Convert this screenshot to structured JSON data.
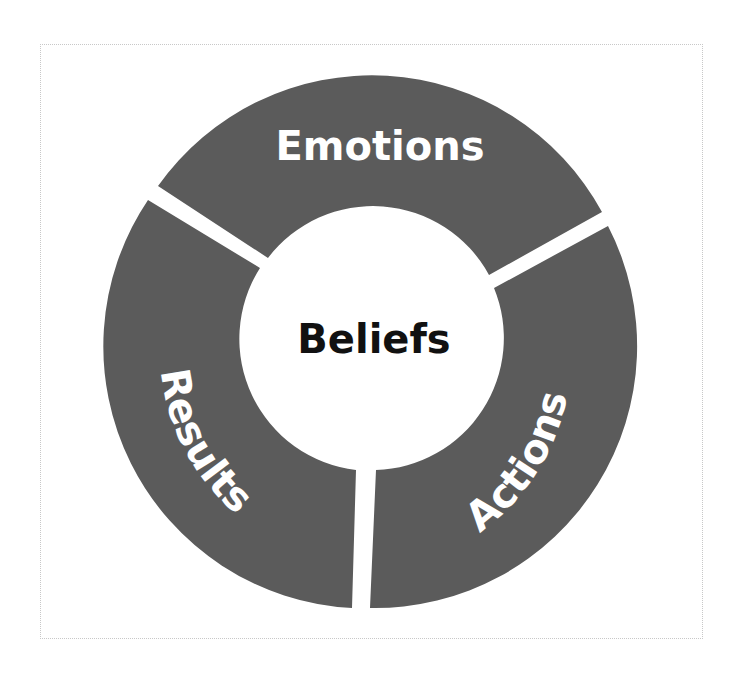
{
  "diagram": {
    "type": "cycle-ring",
    "center": {
      "label": "Beliefs"
    },
    "segments": [
      {
        "label": "Emotions",
        "position": "top"
      },
      {
        "label": "Actions",
        "position": "lower-right"
      },
      {
        "label": "Results",
        "position": "lower-left"
      }
    ],
    "colors": {
      "segment_fill": "#5b5b5b",
      "center_fill": "#ffffff",
      "center_text": "#111111",
      "segment_text": "#ffffff",
      "frame_border": "#c8c8c8"
    }
  }
}
